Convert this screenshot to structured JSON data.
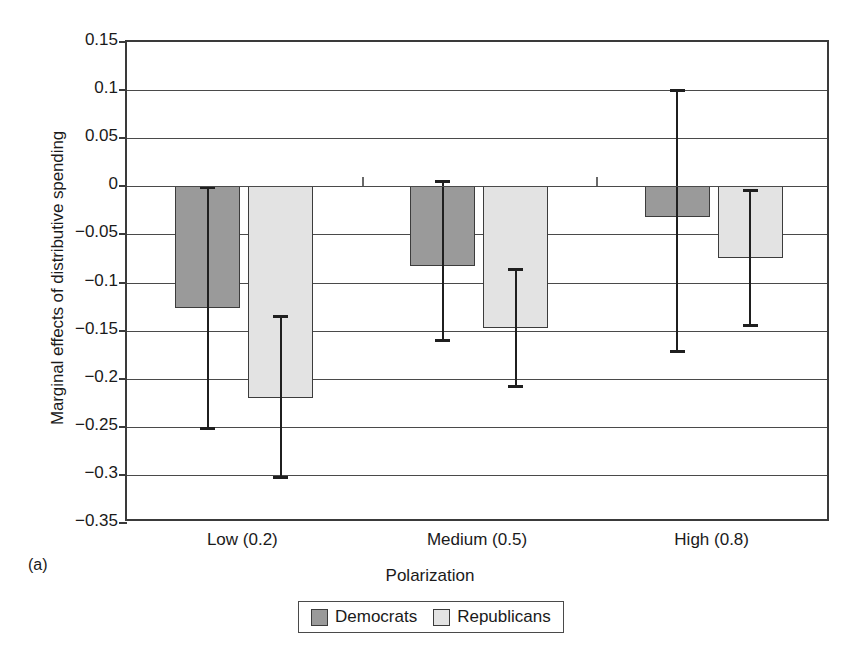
{
  "figure": {
    "panel_label": "(a)"
  },
  "chart_data": {
    "type": "bar",
    "title": "",
    "xlabel": "Polarization",
    "ylabel": "Marginal effects of distributive spending",
    "categories": [
      "Low (0.2)",
      "Medium (0.5)",
      "High (0.8)"
    ],
    "ylim": [
      -0.35,
      0.15
    ],
    "ytick_labels": [
      "0.15",
      "0.1",
      "0.05",
      "0",
      "−0.05",
      "−0.1",
      "−0.15",
      "−0.2",
      "−0.25",
      "−0.3",
      "−0.35"
    ],
    "ytick_values": [
      0.15,
      0.1,
      0.05,
      0,
      -0.05,
      -0.1,
      -0.15,
      -0.2,
      -0.25,
      -0.3,
      -0.35
    ],
    "grid": true,
    "legend_position": "bottom",
    "error_bars": "confidence-interval",
    "series": [
      {
        "name": "Democrats",
        "color": "#9a9a9a",
        "values": [
          -0.127,
          -0.083,
          -0.032
        ],
        "ci_upper": [
          -0.001,
          0.005,
          0.1
        ],
        "ci_lower": [
          -0.252,
          -0.16,
          -0.172
        ]
      },
      {
        "name": "Republicans",
        "color": "#e3e3e3",
        "values": [
          -0.22,
          -0.147,
          -0.075
        ],
        "ci_upper": [
          -0.135,
          -0.086,
          -0.004
        ],
        "ci_lower": [
          -0.303,
          -0.208,
          -0.145
        ]
      }
    ]
  },
  "legend": {
    "items": [
      {
        "label": "Democrats",
        "color": "#9a9a9a"
      },
      {
        "label": "Republicans",
        "color": "#e3e3e3"
      }
    ]
  }
}
